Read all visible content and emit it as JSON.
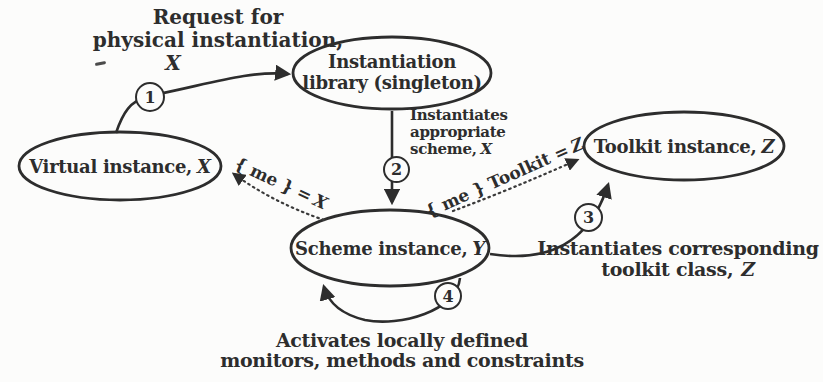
{
  "colors": {
    "background": "#fcfcfb",
    "ink": "#2d2d2d"
  },
  "nodes": {
    "virtual": {
      "label": "Virtual instance,",
      "variable": "X"
    },
    "library": {
      "line1": "Instantiation",
      "line2": "library (singleton)"
    },
    "toolkit": {
      "label": "Toolkit instance,",
      "variable": "Z"
    },
    "scheme": {
      "label": "Scheme instance,",
      "variable": "Y"
    }
  },
  "steps": {
    "one": {
      "number": "1",
      "line1": "Request for",
      "line2": "physical instantiation,",
      "variable": "X"
    },
    "two": {
      "number": "2",
      "line1": "Instantiates",
      "line2": "appropriate",
      "line3": "scheme,",
      "variable": "X"
    },
    "three": {
      "number": "3",
      "line1": "Instantiates corresponding",
      "line2": "toolkit class,",
      "variable": "Z"
    },
    "four": {
      "number": "4",
      "line1": "Activates locally defined",
      "line2": "monitors, methods and constraints"
    }
  },
  "assignments": {
    "me_x": {
      "label": "{ me } =",
      "variable": "X"
    },
    "me_toolkit": {
      "label": "{ me } Toolkit =",
      "variable": "Z"
    }
  }
}
